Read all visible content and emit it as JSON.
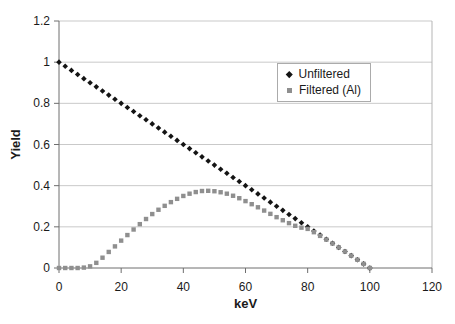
{
  "figure": {
    "background": "#ffffff"
  },
  "colors": {
    "grid": "#c9c9c9",
    "plot_border": "#b5b5b5",
    "axis": "#6e6e6e",
    "text": "#1a1a1a",
    "unfiltered_marker": "#141414",
    "filtered_marker": "#8f8f8f",
    "legend_border": "#ababab"
  },
  "axes": {
    "x_label": "keV",
    "y_label": "Yield"
  },
  "chart_data": {
    "type": "scatter",
    "title": "",
    "xlabel": "keV",
    "ylabel": "Yield",
    "xlim": [
      0,
      120
    ],
    "ylim": [
      0,
      1.2
    ],
    "x_ticks": [
      0,
      20,
      40,
      60,
      80,
      100,
      120
    ],
    "x_tick_labels": [
      "0",
      "20",
      "40",
      "60",
      "80",
      "100",
      "120"
    ],
    "y_ticks": [
      0,
      0.2,
      0.4,
      0.6,
      0.8,
      1,
      1.2
    ],
    "y_tick_labels": [
      "0",
      "0.2",
      "0.4",
      "0.6",
      "0.8",
      "1",
      "1.2"
    ],
    "grid": "horizontal",
    "legend_position": "inside-upper-right",
    "x": [
      0,
      2,
      4,
      6,
      8,
      10,
      12,
      14,
      16,
      18,
      20,
      22,
      24,
      26,
      28,
      30,
      32,
      34,
      36,
      38,
      40,
      42,
      44,
      46,
      48,
      50,
      52,
      54,
      56,
      58,
      60,
      62,
      64,
      66,
      68,
      70,
      72,
      74,
      76,
      78,
      80,
      82,
      84,
      86,
      88,
      90,
      92,
      94,
      96,
      98,
      100
    ],
    "series": [
      {
        "name": "Unfiltered",
        "marker": "diamond",
        "color": "#141414",
        "values": [
          1,
          0.98,
          0.96,
          0.94,
          0.92,
          0.9,
          0.88,
          0.86,
          0.84,
          0.82,
          0.8,
          0.78,
          0.76,
          0.74,
          0.72,
          0.7,
          0.68,
          0.66,
          0.64,
          0.62,
          0.6,
          0.58,
          0.56,
          0.54,
          0.52,
          0.5,
          0.48,
          0.46,
          0.44,
          0.42,
          0.4,
          0.38,
          0.36,
          0.34,
          0.32,
          0.3,
          0.28,
          0.26,
          0.24,
          0.22,
          0.2,
          0.18,
          0.16,
          0.14,
          0.12,
          0.1,
          0.08,
          0.06,
          0.04,
          0.02,
          0
        ]
      },
      {
        "name": "Filtered (Al)",
        "marker": "square",
        "color": "#8f8f8f",
        "values": [
          0,
          0,
          0,
          0,
          0.002,
          0.008,
          0.025,
          0.05,
          0.078,
          0.105,
          0.133,
          0.16,
          0.187,
          0.213,
          0.238,
          0.262,
          0.283,
          0.302,
          0.32,
          0.336,
          0.35,
          0.361,
          0.369,
          0.374,
          0.375,
          0.373,
          0.368,
          0.361,
          0.351,
          0.339,
          0.325,
          0.31,
          0.295,
          0.279,
          0.263,
          0.247,
          0.232,
          0.218,
          0.205,
          0.196,
          0.19,
          0.174,
          0.156,
          0.138,
          0.119,
          0.1,
          0.08,
          0.06,
          0.04,
          0.02,
          0
        ]
      }
    ]
  }
}
